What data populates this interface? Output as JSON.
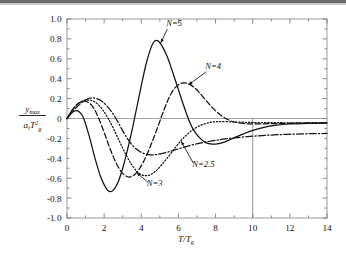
{
  "figure": {
    "background_color": "#ffffff",
    "frame_color": "#9a9a9a",
    "curve_color": "#111111"
  },
  "axis": {
    "x": {
      "label_num": "T",
      "label_den": "T",
      "label_den_sub": "g",
      "ticks": [
        "0",
        "2",
        "4",
        "6",
        "8",
        "10",
        "12",
        "14"
      ],
      "min": 0,
      "max": 14,
      "minor_step": 1
    },
    "y": {
      "label_num": "y",
      "label_num_sub": "max",
      "label_den": "a",
      "label_den_sub1": "t",
      "label_den_T": "T",
      "label_den_sub2": "g",
      "label_den_sup": "2",
      "ticks": [
        "1.0",
        "0.8",
        "0.6",
        "0.4",
        "0.2",
        "0",
        "-0.2",
        "-0.4",
        "-0.6",
        "-0.8",
        "-1.0"
      ],
      "min": -1.0,
      "max": 1.0
    }
  },
  "annotations": [
    {
      "name": "label-n5",
      "text": "N=5",
      "x": 5.35,
      "y": 0.925
    },
    {
      "name": "label-n4",
      "text": "N=4",
      "x": 7.45,
      "y": 0.495
    },
    {
      "name": "label-n3",
      "text": "N=3",
      "x": 4.3,
      "y": -0.68
    },
    {
      "name": "label-n25",
      "text": "N=2.5",
      "x": 6.75,
      "y": -0.49
    }
  ],
  "reference_line": {
    "name": "x-10-reference",
    "x": 10,
    "y_from": 0,
    "y_to": -1.0,
    "color": "#8f8f8f"
  },
  "chart_data": {
    "type": "line",
    "title": "",
    "xlabel": "T/T_g",
    "ylabel": "y_max / (a_t T_g^2)",
    "xlim": [
      0,
      14
    ],
    "ylim": [
      -1.0,
      1.0
    ],
    "grid": false,
    "legend": "inline-annotations",
    "x_ticks": [
      0,
      2,
      4,
      6,
      8,
      10,
      12,
      14
    ],
    "y_ticks": [
      -1.0,
      -0.8,
      -0.6,
      -0.4,
      -0.2,
      0,
      0.2,
      0.4,
      0.6,
      0.8,
      1.0
    ],
    "series": [
      {
        "name": "N=5",
        "linestyle": "solid",
        "points": [
          [
            0.0,
            0.0
          ],
          [
            0.25,
            0.055
          ],
          [
            0.5,
            0.078
          ],
          [
            0.7,
            0.06
          ],
          [
            0.9,
            0.0
          ],
          [
            1.2,
            -0.18
          ],
          [
            1.5,
            -0.395
          ],
          [
            1.8,
            -0.58
          ],
          [
            2.1,
            -0.7
          ],
          [
            2.3,
            -0.735
          ],
          [
            2.5,
            -0.72
          ],
          [
            2.75,
            -0.64
          ],
          [
            3.0,
            -0.5
          ],
          [
            3.25,
            -0.32
          ],
          [
            3.5,
            -0.12
          ],
          [
            3.7,
            0.06
          ],
          [
            4.0,
            0.33
          ],
          [
            4.25,
            0.54
          ],
          [
            4.5,
            0.7
          ],
          [
            4.7,
            0.775
          ],
          [
            4.9,
            0.78
          ],
          [
            5.1,
            0.735
          ],
          [
            5.4,
            0.62
          ],
          [
            5.7,
            0.46
          ],
          [
            6.0,
            0.29
          ],
          [
            6.3,
            0.12
          ],
          [
            6.6,
            -0.035
          ],
          [
            6.9,
            -0.14
          ],
          [
            7.2,
            -0.205
          ],
          [
            7.5,
            -0.245
          ],
          [
            7.8,
            -0.258
          ],
          [
            8.1,
            -0.255
          ],
          [
            8.5,
            -0.235
          ],
          [
            9.0,
            -0.195
          ],
          [
            9.5,
            -0.155
          ],
          [
            10.0,
            -0.12
          ],
          [
            10.6,
            -0.09
          ],
          [
            11.2,
            -0.07
          ],
          [
            12.0,
            -0.055
          ],
          [
            13.0,
            -0.048
          ],
          [
            14.0,
            -0.045
          ]
        ]
      },
      {
        "name": "N=4",
        "linestyle": "dashed",
        "points": [
          [
            0.0,
            0.0
          ],
          [
            0.3,
            0.09
          ],
          [
            0.6,
            0.15
          ],
          [
            0.9,
            0.175
          ],
          [
            1.2,
            0.155
          ],
          [
            1.45,
            0.1
          ],
          [
            1.7,
            0.005
          ],
          [
            2.0,
            -0.14
          ],
          [
            2.3,
            -0.295
          ],
          [
            2.6,
            -0.43
          ],
          [
            2.9,
            -0.53
          ],
          [
            3.15,
            -0.575
          ],
          [
            3.35,
            -0.588
          ],
          [
            3.6,
            -0.57
          ],
          [
            3.9,
            -0.505
          ],
          [
            4.2,
            -0.405
          ],
          [
            4.5,
            -0.275
          ],
          [
            4.8,
            -0.13
          ],
          [
            5.1,
            0.025
          ],
          [
            5.4,
            0.17
          ],
          [
            5.7,
            0.28
          ],
          [
            6.0,
            0.34
          ],
          [
            6.25,
            0.358
          ],
          [
            6.5,
            0.352
          ],
          [
            6.8,
            0.32
          ],
          [
            7.1,
            0.265
          ],
          [
            7.4,
            0.2
          ],
          [
            7.8,
            0.115
          ],
          [
            8.2,
            0.045
          ],
          [
            8.6,
            -0.005
          ],
          [
            9.0,
            -0.035
          ],
          [
            9.5,
            -0.05
          ],
          [
            10.0,
            -0.055
          ],
          [
            11.0,
            -0.052
          ],
          [
            12.0,
            -0.048
          ],
          [
            13.0,
            -0.045
          ],
          [
            14.0,
            -0.045
          ]
        ]
      },
      {
        "name": "N=3",
        "linestyle": "dotted",
        "points": [
          [
            0.0,
            0.0
          ],
          [
            0.3,
            0.09
          ],
          [
            0.6,
            0.15
          ],
          [
            0.9,
            0.18
          ],
          [
            1.2,
            0.185
          ],
          [
            1.4,
            0.175
          ],
          [
            1.65,
            0.145
          ],
          [
            1.95,
            0.08
          ],
          [
            2.25,
            -0.01
          ],
          [
            2.55,
            -0.12
          ],
          [
            2.85,
            -0.24
          ],
          [
            3.15,
            -0.355
          ],
          [
            3.45,
            -0.455
          ],
          [
            3.75,
            -0.53
          ],
          [
            4.0,
            -0.565
          ],
          [
            4.25,
            -0.575
          ],
          [
            4.5,
            -0.565
          ],
          [
            4.8,
            -0.525
          ],
          [
            5.1,
            -0.465
          ],
          [
            5.45,
            -0.385
          ],
          [
            5.8,
            -0.3
          ],
          [
            6.15,
            -0.22
          ],
          [
            6.5,
            -0.155
          ],
          [
            6.9,
            -0.098
          ],
          [
            7.3,
            -0.06
          ],
          [
            7.7,
            -0.04
          ],
          [
            8.1,
            -0.032
          ],
          [
            8.6,
            -0.032
          ],
          [
            9.2,
            -0.036
          ],
          [
            10.0,
            -0.04
          ],
          [
            11.0,
            -0.042
          ],
          [
            12.0,
            -0.043
          ],
          [
            13.0,
            -0.044
          ],
          [
            14.0,
            -0.045
          ]
        ]
      },
      {
        "name": "N=2.5",
        "linestyle": "dashdot",
        "points": [
          [
            0.0,
            0.0
          ],
          [
            0.25,
            0.06
          ],
          [
            0.5,
            0.11
          ],
          [
            0.8,
            0.16
          ],
          [
            1.1,
            0.195
          ],
          [
            1.35,
            0.207
          ],
          [
            1.6,
            0.2
          ],
          [
            1.9,
            0.17
          ],
          [
            2.2,
            0.115
          ],
          [
            2.5,
            0.04
          ],
          [
            2.8,
            -0.055
          ],
          [
            3.05,
            -0.14
          ],
          [
            3.3,
            -0.215
          ],
          [
            3.6,
            -0.285
          ],
          [
            3.9,
            -0.33
          ],
          [
            4.2,
            -0.355
          ],
          [
            4.5,
            -0.365
          ],
          [
            4.85,
            -0.362
          ],
          [
            5.2,
            -0.348
          ],
          [
            5.6,
            -0.328
          ],
          [
            6.0,
            -0.305
          ],
          [
            6.45,
            -0.28
          ],
          [
            6.9,
            -0.258
          ],
          [
            7.4,
            -0.238
          ],
          [
            7.9,
            -0.222
          ],
          [
            8.4,
            -0.208
          ],
          [
            9.0,
            -0.195
          ],
          [
            9.7,
            -0.182
          ],
          [
            10.5,
            -0.172
          ],
          [
            11.3,
            -0.163
          ],
          [
            12.2,
            -0.157
          ],
          [
            13.1,
            -0.153
          ],
          [
            14.0,
            -0.15
          ]
        ]
      }
    ],
    "annotation_arrows": [
      {
        "from_series": "N=5",
        "tip_x": 5.05,
        "tip_y": 0.76
      },
      {
        "from_series": "N=4",
        "tip_x": 6.55,
        "tip_y": 0.34
      },
      {
        "from_series": "N=3",
        "tip_x": 3.75,
        "tip_y": -0.545
      },
      {
        "from_series": "N=2.5",
        "tip_x": 6.15,
        "tip_y": -0.228
      }
    ]
  }
}
